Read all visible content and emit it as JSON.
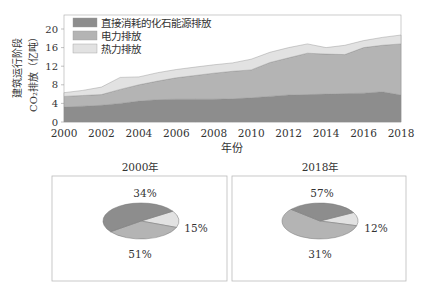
{
  "colors": {
    "direct": "#8d8d8d",
    "electric": "#b4b4b4",
    "heat": "#e2e2e2",
    "axis": "#999999",
    "box_border": "#bbbbbb"
  },
  "area_chart": {
    "ylabel_line1": "建筑运行阶段",
    "ylabel_line2": "CO₂排放（亿吨）",
    "xlabel": "年份",
    "legend": [
      "直接消耗的化石能源排放",
      "电力排放",
      "热力排放"
    ],
    "yticks": [
      "0",
      "4",
      "8",
      "12",
      "16",
      "20"
    ],
    "xticks": [
      "2000",
      "2002",
      "2004",
      "2006",
      "2008",
      "2010",
      "2012",
      "2014",
      "2016",
      "2018"
    ]
  },
  "pie_2000": {
    "title": "2000年",
    "labels": [
      "34%",
      "15%",
      "51%"
    ]
  },
  "pie_2018": {
    "title": "2018年",
    "labels": [
      "57%",
      "12%",
      "31%"
    ]
  },
  "chart_data": [
    {
      "type": "area",
      "title": "",
      "xlabel": "年份",
      "ylabel": "建筑运行阶段 CO₂排放（亿吨）",
      "ylim": [
        0,
        22
      ],
      "x": [
        2000,
        2001,
        2002,
        2003,
        2004,
        2005,
        2006,
        2007,
        2008,
        2009,
        2010,
        2011,
        2012,
        2013,
        2014,
        2015,
        2016,
        2017,
        2018
      ],
      "stacked": true,
      "legend_position": "upper left",
      "series": [
        {
          "name": "直接消耗的化石能源排放",
          "values": [
            3.2,
            3.4,
            3.6,
            4.0,
            4.5,
            4.8,
            4.9,
            4.9,
            4.9,
            5.0,
            5.2,
            5.5,
            5.8,
            5.9,
            6.0,
            6.1,
            6.2,
            6.5,
            5.8
          ]
        },
        {
          "name": "电力排放",
          "values": [
            2.3,
            2.3,
            2.3,
            3.0,
            3.5,
            4.0,
            4.6,
            5.1,
            5.6,
            5.9,
            6.0,
            7.3,
            8.0,
            8.9,
            8.6,
            8.4,
            9.8,
            10.0,
            11.0
          ]
        },
        {
          "name": "热力排放",
          "values": [
            0.8,
            1.1,
            1.6,
            2.6,
            1.7,
            1.8,
            1.8,
            1.8,
            1.8,
            1.8,
            2.3,
            2.2,
            2.2,
            2.0,
            1.4,
            2.0,
            1.5,
            1.7,
            1.9
          ]
        }
      ]
    },
    {
      "type": "pie",
      "title": "2000年",
      "categories": [
        "直接消耗的化石能源排放",
        "电力排放",
        "热力排放"
      ],
      "values": [
        51,
        34,
        15
      ]
    },
    {
      "type": "pie",
      "title": "2018年",
      "categories": [
        "直接消耗的化石能源排放",
        "电力排放",
        "热力排放"
      ],
      "values": [
        31,
        57,
        12
      ]
    }
  ]
}
